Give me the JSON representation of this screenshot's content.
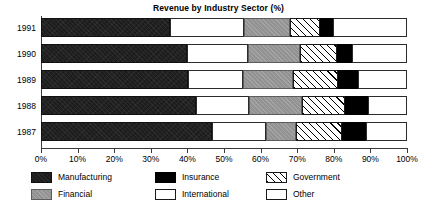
{
  "chart_data": {
    "type": "bar",
    "orientation": "horizontal",
    "stacked": true,
    "title": "Revenue by Industry Sector (%)",
    "xlabel": "",
    "ylabel": "",
    "xlim": [
      0,
      100
    ],
    "grid": false,
    "legend_position": "bottom",
    "categories": [
      "1991",
      "1990",
      "1989",
      "1988",
      "1987"
    ],
    "xtick_labels": [
      "0%",
      "10%",
      "20%",
      "30%",
      "40%",
      "50%",
      "60%",
      "70%",
      "80%",
      "90%",
      "100%"
    ],
    "xtick_values": [
      0,
      10,
      20,
      30,
      40,
      50,
      60,
      70,
      80,
      90,
      100
    ],
    "series": [
      {
        "name": "Manufacturing",
        "pattern": "dark-solid",
        "color": "#1d1d1d",
        "values": [
          35.2,
          40.0,
          40.2,
          42.3,
          46.7
        ]
      },
      {
        "name": "International",
        "pattern": "white",
        "color": "#ffffff",
        "values": [
          20.3,
          16.5,
          15.0,
          14.5,
          14.8
        ]
      },
      {
        "name": "Financial",
        "pattern": "gray",
        "color": "#9a9a9a",
        "values": [
          12.5,
          14.3,
          13.7,
          14.5,
          8.2
        ]
      },
      {
        "name": "Government",
        "pattern": "diagonal-hatch",
        "color": "#ffffff",
        "values": [
          8.2,
          10.1,
          12.2,
          11.8,
          12.5
        ]
      },
      {
        "name": "Insurance",
        "pattern": "black",
        "color": "#000000",
        "values": [
          3.6,
          4.1,
          5.5,
          6.2,
          6.6
        ]
      },
      {
        "name": "Other",
        "pattern": "white",
        "color": "#ffffff",
        "values": [
          20.2,
          15.0,
          13.4,
          10.7,
          11.2
        ]
      }
    ]
  },
  "title": "Revenue by Industry Sector (%)",
  "legend": {
    "items": [
      {
        "label": "Manufacturing"
      },
      {
        "label": "Financial"
      },
      {
        "label": "Insurance"
      },
      {
        "label": "International"
      },
      {
        "label": "Government"
      },
      {
        "label": "Other"
      }
    ]
  }
}
